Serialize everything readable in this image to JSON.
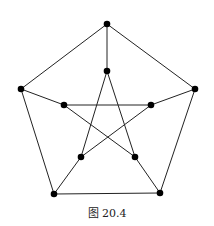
{
  "figure": {
    "caption": "图 20.4",
    "graph_name": "Petersen graph",
    "edge_color": "#222222",
    "node_color": "#000000",
    "node_radius": 3.3,
    "nodes": [
      {
        "id": "o1",
        "x": 107,
        "y": 24
      },
      {
        "id": "o2",
        "x": 195,
        "y": 89
      },
      {
        "id": "o3",
        "x": 160,
        "y": 193
      },
      {
        "id": "o4",
        "x": 54,
        "y": 194
      },
      {
        "id": "o5",
        "x": 21,
        "y": 89
      },
      {
        "id": "i1",
        "x": 107,
        "y": 71
      },
      {
        "id": "i2",
        "x": 151,
        "y": 105
      },
      {
        "id": "i3",
        "x": 135,
        "y": 157
      },
      {
        "id": "i4",
        "x": 81,
        "y": 157
      },
      {
        "id": "i5",
        "x": 64,
        "y": 105
      }
    ],
    "edges": [
      [
        "o1",
        "o2"
      ],
      [
        "o2",
        "o3"
      ],
      [
        "o3",
        "o4"
      ],
      [
        "o4",
        "o5"
      ],
      [
        "o5",
        "o1"
      ],
      [
        "o1",
        "i1"
      ],
      [
        "o2",
        "i2"
      ],
      [
        "o3",
        "i3"
      ],
      [
        "o4",
        "i4"
      ],
      [
        "o5",
        "i5"
      ],
      [
        "i1",
        "i3"
      ],
      [
        "i3",
        "i5"
      ],
      [
        "i5",
        "i2"
      ],
      [
        "i2",
        "i4"
      ],
      [
        "i4",
        "i1"
      ]
    ]
  }
}
